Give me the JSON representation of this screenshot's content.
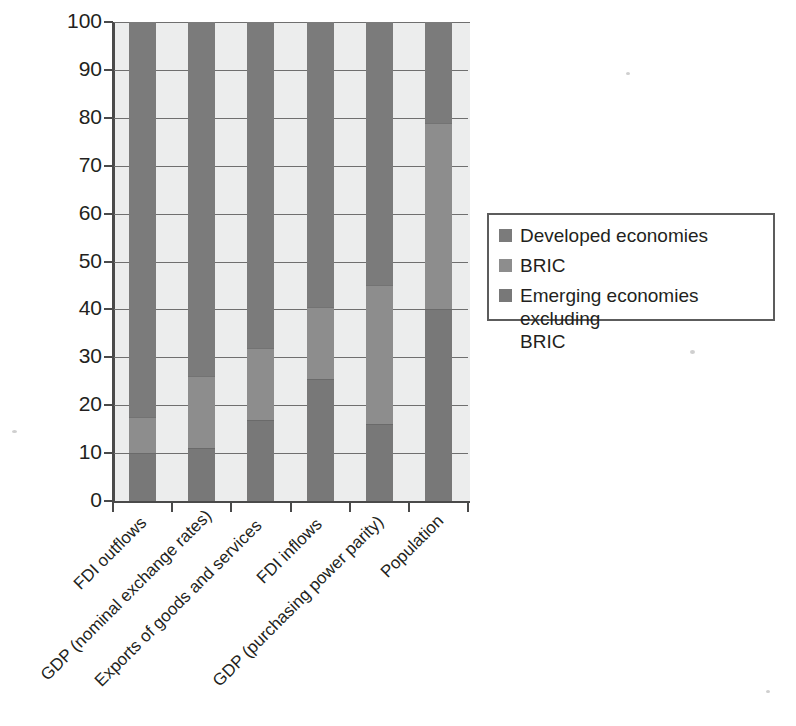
{
  "chart_data": {
    "type": "bar",
    "subtype": "100% stacked column",
    "title": "",
    "subtitle": "",
    "xlabel": "",
    "ylabel": "",
    "ylim": [
      0,
      100
    ],
    "yticks": [
      0,
      10,
      20,
      30,
      40,
      50,
      60,
      70,
      80,
      90,
      100
    ],
    "grid": true,
    "legend_position": "right",
    "categories": [
      "FDI outflows",
      "GDP (nominal exchange rates)",
      "Exports of goods and services",
      "FDI inflows",
      "GDP (purchasing power parity)",
      "Population"
    ],
    "series": [
      {
        "name": "Developed economies",
        "color": "#7b7b7b",
        "values": [
          82.5,
          74,
          68,
          60,
          55,
          21
        ]
      },
      {
        "name": "BRIC",
        "color": "#8d8d8d",
        "values": [
          7.5,
          15,
          15,
          15,
          29,
          39
        ]
      },
      {
        "name": "Emerging economies excluding BRIC",
        "color": "#787878",
        "values": [
          10,
          11,
          17,
          25,
          16,
          40
        ]
      }
    ],
    "stack_boundaries": [
      {
        "category": "FDI outflows",
        "emerging_top": 10,
        "bric_top": 17.5
      },
      {
        "category": "GDP (nominal exchange rates)",
        "emerging_top": 11,
        "bric_top": 26
      },
      {
        "category": "Exports of goods and services",
        "emerging_top": 17,
        "bric_top": 32
      },
      {
        "category": "FDI inflows",
        "emerging_top": 25.5,
        "bric_top": 40.5
      },
      {
        "category": "GDP (purchasing power parity)",
        "emerging_top": 16,
        "bric_top": 45
      },
      {
        "category": "Population",
        "emerging_top": 40,
        "bric_top": 79
      }
    ]
  },
  "axis": {
    "y_tick_labels": [
      "100",
      "90",
      "80",
      "70",
      "60",
      "50",
      "40",
      "30",
      "20",
      "10",
      "0"
    ]
  },
  "legend": {
    "items": [
      {
        "label": "Developed economies",
        "label_line2": "",
        "color": "#7b7b7b"
      },
      {
        "label": "BRIC",
        "label_line2": "",
        "color": "#8d8d8d"
      },
      {
        "label": "Emerging economies excluding",
        "label_line2": "BRIC",
        "color": "#787878"
      }
    ]
  }
}
